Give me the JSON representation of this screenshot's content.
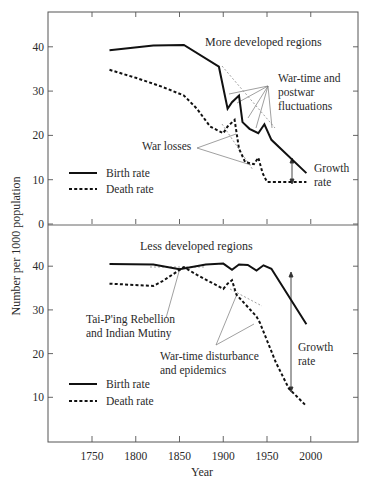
{
  "chart_data": [
    {
      "type": "line",
      "title": "More developed regions",
      "xlabel": "Year",
      "ylabel": "Number per 1000 population",
      "xlim": [
        1700,
        2050
      ],
      "ylim": [
        0,
        48
      ],
      "yticks": [
        0,
        10,
        20,
        30,
        40
      ],
      "xticks": [
        1750,
        1800,
        1850,
        1900,
        1950,
        2000
      ],
      "grid": false,
      "legend_position": "lower-left",
      "series": [
        {
          "name": "Birth rate",
          "style": "solid",
          "x": [
            1770,
            1820,
            1855,
            1895,
            1905,
            1910,
            1918,
            1922,
            1930,
            1940,
            1947,
            1955,
            1995
          ],
          "y": [
            39.2,
            40.3,
            40.4,
            35.5,
            26,
            27.5,
            29,
            23,
            21.5,
            20.5,
            22.5,
            19,
            11.5
          ]
        },
        {
          "name": "Death rate",
          "style": "dashed",
          "x": [
            1770,
            1800,
            1830,
            1855,
            1870,
            1885,
            1900,
            1905,
            1913,
            1918,
            1925,
            1935,
            1940,
            1945,
            1950,
            1995
          ],
          "y": [
            34.8,
            33,
            31,
            29,
            26,
            22,
            20.5,
            22,
            23.5,
            17,
            14,
            13.5,
            15,
            11.5,
            9.5,
            9.5
          ]
        }
      ],
      "annotations": [
        {
          "text": "War-time and postwar fluctuations"
        },
        {
          "text": "War losses"
        },
        {
          "text": "Growth rate"
        }
      ]
    },
    {
      "type": "line",
      "title": "Less developed regions",
      "xlabel": "Year",
      "ylabel": "Number per 1000 population",
      "xlim": [
        1700,
        2050
      ],
      "ylim": [
        0,
        48
      ],
      "yticks": [
        10,
        20,
        30,
        40
      ],
      "xticks": [
        1750,
        1800,
        1850,
        1900,
        1950,
        2000
      ],
      "grid": false,
      "legend_position": "lower-left",
      "series": [
        {
          "name": "Birth rate",
          "style": "solid",
          "x": [
            1770,
            1820,
            1850,
            1880,
            1900,
            1910,
            1918,
            1928,
            1938,
            1946,
            1955,
            1995
          ],
          "y": [
            40.5,
            40.4,
            39.3,
            40.4,
            40.6,
            39.2,
            40.4,
            40.3,
            39,
            40.2,
            39.4,
            26.7
          ]
        },
        {
          "name": "Death rate",
          "style": "dashed",
          "x": [
            1770,
            1820,
            1830,
            1855,
            1870,
            1900,
            1905,
            1910,
            1915,
            1938,
            1942,
            1960,
            1975,
            1995
          ],
          "y": [
            36,
            35.5,
            36.5,
            39.8,
            38,
            34.8,
            36,
            36.8,
            33.5,
            28.5,
            27,
            18,
            12,
            8
          ]
        }
      ],
      "annotations": [
        {
          "text": "Tai-P'ing Rebellion and Indian Mutiny"
        },
        {
          "text": "War-time disturbance and epidemics"
        },
        {
          "text": "Growth rate"
        }
      ]
    }
  ],
  "labels": {
    "ylabel": "Number per 1000 population",
    "xlabel": "Year",
    "top_title": "More developed regions",
    "bottom_title": "Less developed regions",
    "top_ann_war_fluct": [
      "War-time and",
      "postwar",
      "fluctuations"
    ],
    "top_ann_war_losses": "War losses",
    "top_ann_growth": [
      "Growth",
      "rate"
    ],
    "bottom_ann_taiping": [
      "Tai-P'ing Rebellion",
      "and Indian Mutiny"
    ],
    "bottom_ann_wartime": [
      "War-time disturbance",
      "and epidemics"
    ],
    "bottom_ann_growth": [
      "Growth",
      "rate"
    ],
    "legend_birth": "Birth rate",
    "legend_death": "Death rate",
    "top_yticks": [
      "0",
      "10",
      "20",
      "30",
      "40"
    ],
    "bottom_yticks": [
      "10",
      "20",
      "30",
      "40"
    ],
    "xticks": [
      "1750",
      "1800",
      "1850",
      "1900",
      "1950",
      "2000"
    ]
  }
}
